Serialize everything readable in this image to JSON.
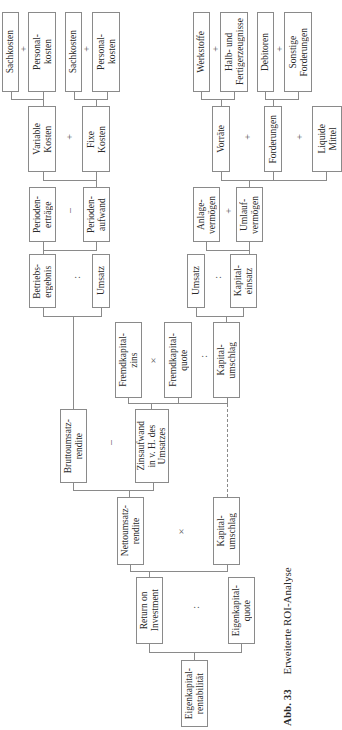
{
  "figure": {
    "caption_number": "Abb. 33",
    "caption_title": "Erweiterte ROI-Analyse"
  },
  "nodes": {
    "sachkosten_1": "Sachkosten",
    "personalkosten_1": "Personal-\nkosten",
    "sachkosten_2": "Sachkosten",
    "personalkosten_2": "Personal-\nkosten",
    "variable_kosten": "Variable\nKosten",
    "fixe_kosten": "Fixe\nKosten",
    "periodenertraege": "Perioden-\nerträge",
    "periodenaufwand": "Perioden-\naufwand",
    "betriebsergebnis": "Betriebs-\nergebnis",
    "umsatz_1": "Umsatz",
    "werkstoffe": "Werkstoffe",
    "halb_fertigerzeugnisse": "Halb- und\nFertigerzeugnisse",
    "debitoren": "Debitoren",
    "sonstige_forderungen": "Sonstige\nForderungen",
    "vorraete": "Vorräte",
    "forderungen": "Forderungen",
    "liquide_mittel": "Liquide\nMittel",
    "anlagevermoegen": "Anlage-\nvermögen",
    "umlaufvermoegen": "Umlauf-\nvermögen",
    "umsatz_2": "Umsatz",
    "kapitaleinsatz": "Kapital-\neinsatz",
    "fremdkapitalzins": "Fremdkapital-\nzins",
    "fremdkapitalquote": "Fremdkapital-\nquote",
    "kapitalumschlag_1": "Kapital-\numschlag",
    "bruttoumsatzrendite": "Bruttoumsatz-\nrendite",
    "zinsaufwand": "Zinsaufwand\nin v. H. des\nUmsatzes",
    "nettoumsatzrendite": "Nettoumsatz-\nrendite",
    "kapitalumschlag_2": "Kapital-\numschlag",
    "return_on_investment": "Return on\nInvestment",
    "eigenkapitalquote": "Eigenkapital-\nquote",
    "eigenkapitalrentabilitaet": "Eigenkapital-\nrentabilität"
  },
  "operators": {
    "plus": "+",
    "minus": "–",
    "times": "×",
    "divide": ":"
  }
}
